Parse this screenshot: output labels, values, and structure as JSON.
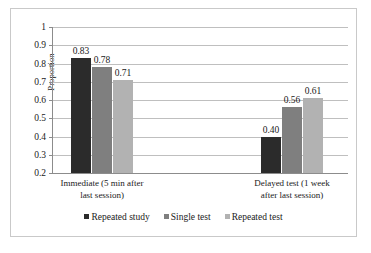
{
  "chart_data": {
    "type": "bar",
    "title": "",
    "xlabel": "",
    "ylabel": "Proportion",
    "ylim": [
      0.2,
      1
    ],
    "ytick_step": 0.1,
    "grid": true,
    "legend_position": "bottom",
    "categories": [
      "Immediate (5 min after last session)",
      "Delayed test (1 week after last session)"
    ],
    "category_lines": [
      [
        "Immediate (5 min after",
        "last session)"
      ],
      [
        "Delayed test (1 week",
        "after last session)"
      ]
    ],
    "ytick_labels": [
      "1",
      "0.9",
      "0.8",
      "0.7",
      "0.6",
      "0.5",
      "0.4",
      "0.3",
      "0.2"
    ],
    "ytick_values": [
      1,
      0.9,
      0.8,
      0.7,
      0.6,
      0.5,
      0.4,
      0.3,
      0.2
    ],
    "series": [
      {
        "name": "Repeated study",
        "color": "#2b2b2b",
        "values": [
          0.83,
          0.4
        ],
        "labels": [
          "0.83",
          "0.40"
        ]
      },
      {
        "name": "Single test",
        "color": "#7f7f7f",
        "values": [
          0.78,
          0.56
        ],
        "labels": [
          "0.78",
          "0.56"
        ]
      },
      {
        "name": "Repeated test",
        "color": "#b2b2b2",
        "values": [
          0.71,
          0.61
        ],
        "labels": [
          "0.71",
          "0.61"
        ]
      }
    ]
  },
  "legend": {
    "items": [
      {
        "label": "Repeated study",
        "color": "#2b2b2b"
      },
      {
        "label": "Single test",
        "color": "#7f7f7f"
      },
      {
        "label": "Repeated test",
        "color": "#b2b2b2"
      }
    ]
  }
}
